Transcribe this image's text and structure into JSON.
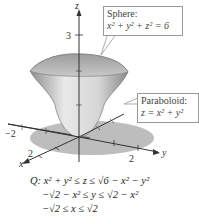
{
  "axes": {
    "z_label": "z",
    "y_label": "y",
    "x_label": "x",
    "z_tick_3": "3",
    "y_tick_2": "2",
    "x_tick_2": "2",
    "neg_tick": "−2"
  },
  "callouts": {
    "sphere": {
      "title": "Sphere:",
      "equation": "x² + y² + z² = 6"
    },
    "paraboloid": {
      "title": "Paraboloid:",
      "equation": "z = x² + y²"
    }
  },
  "region": {
    "line1": "Q: x² + y² ≤ z ≤ √6 − x² − y²",
    "line2": "−√2 − x² ≤ y ≤ √2 − x²",
    "line3": "−√2 ≤ x ≤ √2"
  },
  "colors": {
    "solid_light": "#e6e6e6",
    "solid_dark": "#9a9a9a",
    "shadow": "#b9b9b9",
    "axis": "#333333"
  }
}
